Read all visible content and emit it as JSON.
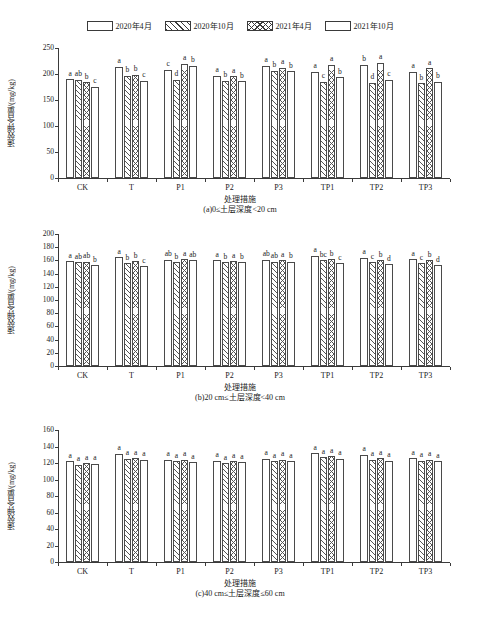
{
  "top_note": "",
  "legend": {
    "items": [
      {
        "label": "2020年4月",
        "pattern": "blank"
      },
      {
        "label": "2020年10月",
        "pattern": "diagonal-hatch"
      },
      {
        "label": "2021年4月",
        "pattern": "crosshatch"
      },
      {
        "label": "2021年10月",
        "pattern": "blank"
      }
    ]
  },
  "chart_data": [
    {
      "type": "bar",
      "title": "(a)0≤土层深度<20 cm",
      "xlabel": "处理措施",
      "ylabel": "速效钾含量/(mg/kg)",
      "ylim": [
        0,
        250
      ],
      "yticks": [
        0,
        50,
        100,
        150,
        200,
        250
      ],
      "ytick_labels": [
        "0",
        "50",
        "100",
        "150",
        "200",
        "250"
      ],
      "grid": false,
      "legend_position": "top-shared",
      "categories": [
        "CK",
        "T",
        "P1",
        "P2",
        "P3",
        "TP1",
        "TP2",
        "TP3"
      ],
      "series": [
        {
          "name": "2020年4月",
          "values": [
            190,
            214,
            208,
            197,
            216,
            204,
            218,
            204
          ],
          "annotations": [
            "a",
            "a",
            "c",
            "a",
            "a",
            "a",
            "b",
            "a"
          ]
        },
        {
          "name": "2020年10月",
          "values": [
            189,
            197,
            189,
            187,
            206,
            185,
            183,
            182
          ],
          "annotations": [
            "ab",
            "b",
            "d",
            "b",
            "b",
            "c",
            "d",
            "b"
          ]
        },
        {
          "name": "2021年4月",
          "values": [
            184,
            199,
            220,
            196,
            212,
            218,
            222,
            211
          ],
          "annotations": [
            "b",
            "b",
            "a",
            "a",
            "a",
            "a",
            "a",
            "a"
          ]
        },
        {
          "name": "2021年10月",
          "values": [
            176,
            187,
            216,
            186,
            205,
            194,
            189,
            185
          ],
          "annotations": [
            "c",
            "c",
            "b",
            "b",
            "b",
            "b",
            "c",
            "b"
          ]
        }
      ]
    },
    {
      "type": "bar",
      "title": "(b)20 cm≤土层深度<40 cm",
      "xlabel": "处理措施",
      "ylabel": "速效钾含量/(mg/kg)",
      "ylim": [
        0,
        200
      ],
      "yticks": [
        0,
        20,
        40,
        60,
        80,
        100,
        120,
        140,
        160,
        180,
        200
      ],
      "ytick_labels": [
        "0",
        "20",
        "40",
        "60",
        "80",
        "100",
        "120",
        "140",
        "160",
        "180",
        "200"
      ],
      "grid": false,
      "legend_position": "top-shared",
      "categories": [
        "CK",
        "T",
        "P1",
        "P2",
        "P3",
        "TP1",
        "TP2",
        "TP3"
      ],
      "series": [
        {
          "name": "2020年4月",
          "values": [
            159,
            165,
            161,
            160,
            161,
            167,
            164,
            162
          ],
          "annotations": [
            "a",
            "a",
            "ab",
            "a",
            "ab",
            "a",
            "a",
            "a"
          ]
        },
        {
          "name": "2020年10月",
          "values": [
            157,
            156,
            157,
            157,
            158,
            160,
            157,
            156
          ],
          "annotations": [
            "ab",
            "b",
            "b",
            "b",
            "ab",
            "bc",
            "c",
            "c"
          ]
        },
        {
          "name": "2021年4月",
          "values": [
            158,
            159,
            162,
            159,
            160,
            162,
            160,
            160
          ],
          "annotations": [
            "ab",
            "b",
            "a",
            "a",
            "a",
            "b",
            "b",
            "b"
          ]
        },
        {
          "name": "2021年10月",
          "values": [
            153,
            151,
            160,
            157,
            158,
            156,
            154,
            153
          ],
          "annotations": [
            "b",
            "c",
            "ab",
            "b",
            "b",
            "c",
            "d",
            "d"
          ]
        }
      ]
    },
    {
      "type": "bar",
      "title": "(c)40 cm≤土层深度≤60 cm",
      "xlabel": "处理措施",
      "ylabel": "速效钾含量/(mg/kg)",
      "ylim": [
        0,
        160
      ],
      "yticks": [
        0,
        20,
        40,
        60,
        80,
        100,
        120,
        140,
        160
      ],
      "ytick_labels": [
        "0",
        "20",
        "40",
        "60",
        "80",
        "100",
        "120",
        "140",
        "160"
      ],
      "grid": false,
      "legend_position": "top-shared",
      "categories": [
        "CK",
        "T",
        "P1",
        "P2",
        "P3",
        "TP1",
        "TP2",
        "TP3"
      ],
      "series": [
        {
          "name": "2020年4月",
          "values": [
            122,
            131,
            124,
            123,
            125,
            132,
            130,
            126
          ],
          "annotations": [
            "a",
            "a",
            "a",
            "a",
            "a",
            "a",
            "a",
            "a"
          ]
        },
        {
          "name": "2020年10月",
          "values": [
            118,
            125,
            122,
            120,
            122,
            127,
            124,
            123
          ],
          "annotations": [
            "a",
            "a",
            "a",
            "a",
            "a",
            "a",
            "a",
            "a"
          ]
        },
        {
          "name": "2021年4月",
          "values": [
            120,
            126,
            124,
            122,
            124,
            128,
            126,
            124
          ],
          "annotations": [
            "a",
            "a",
            "a",
            "a",
            "a",
            "a",
            "a",
            "a"
          ]
        },
        {
          "name": "2021年10月",
          "values": [
            119,
            124,
            121,
            121,
            122,
            125,
            123,
            122
          ],
          "annotations": [
            "a",
            "a",
            "a",
            "a",
            "a",
            "a",
            "a",
            "a"
          ]
        }
      ]
    }
  ]
}
